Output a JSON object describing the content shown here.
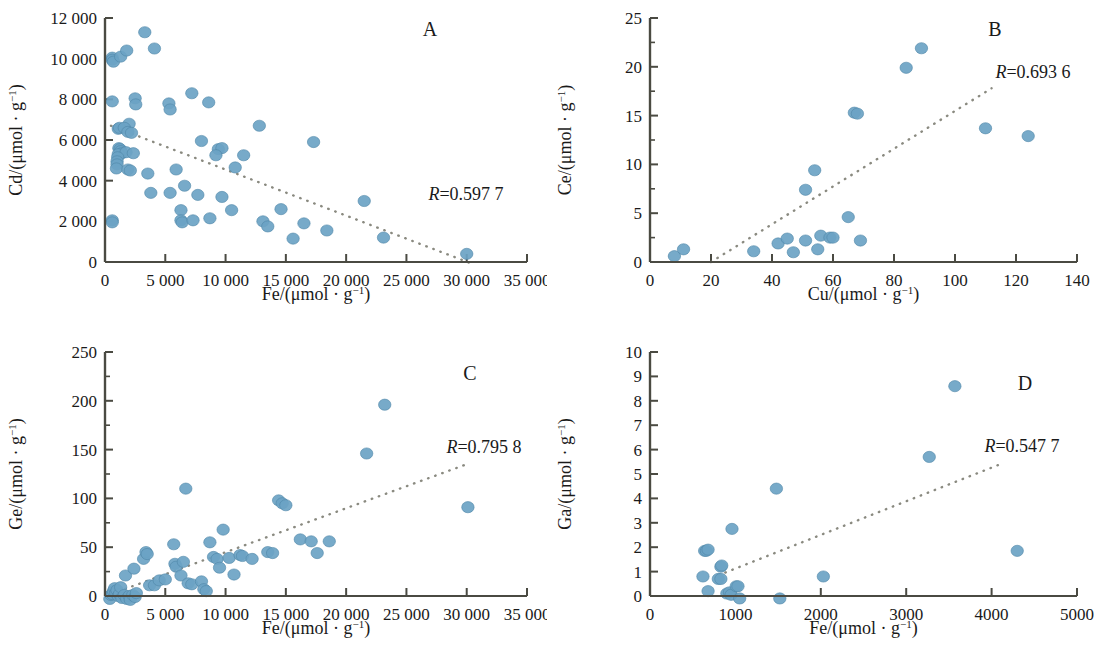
{
  "figure": {
    "background": "#ffffff",
    "point_color": "#6ba3c4",
    "point_stroke": "#4f87a8",
    "axis_color": "#4a4a42",
    "trend_color": "#8a8a80"
  },
  "panels": [
    {
      "id": "panel-a",
      "letter": "A",
      "r_prefix": "R",
      "r_equals": "=",
      "r_value": "0.597 7",
      "r_text": "R=0.597 7",
      "chart_data": {
        "type": "scatter",
        "title": "A",
        "xlabel": "Fe/(μmol · g⁻¹)",
        "ylabel": "Cd/(μmol · g⁻¹)",
        "xlim": [
          0,
          35000
        ],
        "ylim": [
          0,
          12000
        ],
        "xticks": [
          0,
          5000,
          10000,
          15000,
          20000,
          25000,
          30000,
          35000
        ],
        "xtick_labels": [
          "0",
          "5 000",
          "10 000",
          "15 000",
          "20 000",
          "25 000",
          "30 000",
          "35 000"
        ],
        "yticks": [
          0,
          2000,
          4000,
          6000,
          8000,
          10000,
          12000
        ],
        "ytick_labels": [
          "0",
          "2 000",
          "4 000",
          "6 000",
          "8 000",
          "10 000",
          "12 000"
        ],
        "grid": false,
        "legend": "none",
        "annotations": [
          {
            "text": "R=0.597 7",
            "x": 25500,
            "y": 3000
          }
        ],
        "trendline": {
          "x": [
            500,
            30500
          ],
          "y": [
            6700,
            -100
          ],
          "style": "dotted"
        },
        "points": [
          [
            600,
            10050
          ],
          [
            600,
            9950
          ],
          [
            700,
            9850
          ],
          [
            1300,
            10100
          ],
          [
            1800,
            10400
          ],
          [
            3300,
            11300
          ],
          [
            4100,
            10500
          ],
          [
            600,
            7900
          ],
          [
            2500,
            8050
          ],
          [
            2550,
            7750
          ],
          [
            5300,
            7800
          ],
          [
            5400,
            7500
          ],
          [
            7200,
            8300
          ],
          [
            8600,
            7850
          ],
          [
            2000,
            6800
          ],
          [
            1100,
            6550
          ],
          [
            1200,
            6600
          ],
          [
            1600,
            6600
          ],
          [
            1900,
            6400
          ],
          [
            2200,
            6350
          ],
          [
            12800,
            6700
          ],
          [
            17300,
            5900
          ],
          [
            8000,
            5950
          ],
          [
            9400,
            5550
          ],
          [
            9700,
            5600
          ],
          [
            9200,
            5250
          ],
          [
            11500,
            5250
          ],
          [
            1150,
            5600
          ],
          [
            1250,
            5550
          ],
          [
            1300,
            5450
          ],
          [
            1400,
            5350
          ],
          [
            1100,
            5300
          ],
          [
            1750,
            5400
          ],
          [
            2350,
            5350
          ],
          [
            1050,
            5150
          ],
          [
            1000,
            4950
          ],
          [
            1000,
            4800
          ],
          [
            950,
            4600
          ],
          [
            1900,
            4550
          ],
          [
            2100,
            4500
          ],
          [
            3550,
            4350
          ],
          [
            5900,
            4550
          ],
          [
            10800,
            4650
          ],
          [
            6600,
            3750
          ],
          [
            3800,
            3400
          ],
          [
            5400,
            3400
          ],
          [
            7700,
            3300
          ],
          [
            9700,
            3200
          ],
          [
            21500,
            3000
          ],
          [
            6300,
            2550
          ],
          [
            10500,
            2550
          ],
          [
            14600,
            2600
          ],
          [
            6300,
            2050
          ],
          [
            6400,
            1950
          ],
          [
            7300,
            2050
          ],
          [
            8700,
            2150
          ],
          [
            600,
            2050
          ],
          [
            600,
            1950
          ],
          [
            13100,
            2000
          ],
          [
            13500,
            1750
          ],
          [
            16500,
            1900
          ],
          [
            18400,
            1550
          ],
          [
            15600,
            1150
          ],
          [
            23100,
            1200
          ],
          [
            30000,
            400
          ]
        ]
      }
    },
    {
      "id": "panel-b",
      "letter": "B",
      "r_prefix": "R",
      "r_equals": "=",
      "r_value": "0.693 6",
      "r_text": "R=0.693 6",
      "chart_data": {
        "type": "scatter",
        "title": "B",
        "xlabel": "Cu/(μmol · g⁻¹)",
        "ylabel": "Ce/(μmol · g⁻¹)",
        "xlim": [
          0,
          140
        ],
        "ylim": [
          0,
          25
        ],
        "xticks": [
          0,
          20,
          40,
          60,
          80,
          100,
          120,
          140
        ],
        "xtick_labels": [
          "0",
          "20",
          "40",
          "60",
          "80",
          "100",
          "120",
          "140"
        ],
        "yticks": [
          0,
          5,
          10,
          15,
          20,
          25
        ],
        "ytick_labels": [
          "0",
          "5",
          "10",
          "15",
          "20",
          "25"
        ],
        "minor_yticks": [
          2.5,
          7.5,
          12.5,
          17.5,
          22.5
        ],
        "grid": false,
        "legend": "none",
        "annotations": [
          {
            "text": "R=0.693 6",
            "x": 122,
            "y": 20.5
          }
        ],
        "trendline": {
          "x": [
            20,
            112
          ],
          "y": [
            0,
            17.8
          ],
          "style": "dotted"
        },
        "points": [
          [
            8,
            0.6
          ],
          [
            11,
            1.3
          ],
          [
            34,
            1.1
          ],
          [
            42,
            1.9
          ],
          [
            45,
            2.4
          ],
          [
            47,
            1.0
          ],
          [
            51,
            2.2
          ],
          [
            51,
            7.4
          ],
          [
            54,
            9.4
          ],
          [
            55,
            1.3
          ],
          [
            56,
            2.7
          ],
          [
            59,
            2.5
          ],
          [
            60,
            2.5
          ],
          [
            65,
            4.6
          ],
          [
            67,
            15.3
          ],
          [
            68,
            15.2
          ],
          [
            69,
            2.2
          ],
          [
            84,
            19.9
          ],
          [
            89,
            21.9
          ],
          [
            110,
            13.7
          ],
          [
            124,
            12.9
          ]
        ]
      }
    },
    {
      "id": "panel-c",
      "letter": "C",
      "r_prefix": "R",
      "r_equals": "=",
      "r_value": "0.795 8",
      "r_text": "R=0.795 8",
      "chart_data": {
        "type": "scatter",
        "title": "C",
        "xlabel": "Fe/(μmol · g⁻¹)",
        "ylabel": "Ge/(μmol · g⁻¹)",
        "xlim": [
          0,
          35000
        ],
        "ylim": [
          0,
          250
        ],
        "xticks": [
          0,
          5000,
          10000,
          15000,
          20000,
          25000,
          30000,
          35000
        ],
        "xtick_labels": [
          "0",
          "5 000",
          "10 000",
          "15 000",
          "20 000",
          "25 000",
          "30 000",
          "35 000"
        ],
        "yticks": [
          0,
          50,
          100,
          150,
          200,
          250
        ],
        "ytick_labels": [
          "0",
          "50",
          "100",
          "150",
          "200",
          "250"
        ],
        "minor_yticks": [
          25,
          75,
          125,
          175,
          225
        ],
        "grid": false,
        "legend": "none",
        "annotations": [
          {
            "text": "R=0.795 8",
            "x": 26500,
            "y": 150
          }
        ],
        "trendline": {
          "x": [
            500,
            30000
          ],
          "y": [
            2,
            135
          ],
          "style": "dotted"
        },
        "points": [
          [
            400,
            -3
          ],
          [
            500,
            1
          ],
          [
            600,
            2
          ],
          [
            700,
            5
          ],
          [
            800,
            8
          ],
          [
            900,
            3
          ],
          [
            1000,
            6
          ],
          [
            1100,
            0
          ],
          [
            1200,
            2
          ],
          [
            1300,
            9
          ],
          [
            1400,
            -2
          ],
          [
            1600,
            1
          ],
          [
            1800,
            -3
          ],
          [
            2000,
            0
          ],
          [
            2100,
            -4
          ],
          [
            2300,
            1
          ],
          [
            2500,
            -1
          ],
          [
            2600,
            3
          ],
          [
            1700,
            21
          ],
          [
            2400,
            28
          ],
          [
            3200,
            38
          ],
          [
            3400,
            45
          ],
          [
            3500,
            43
          ],
          [
            3700,
            11
          ],
          [
            4100,
            11
          ],
          [
            4500,
            16
          ],
          [
            5000,
            17
          ],
          [
            5700,
            53
          ],
          [
            5800,
            33
          ],
          [
            5900,
            30
          ],
          [
            6300,
            21
          ],
          [
            6500,
            35
          ],
          [
            6700,
            110
          ],
          [
            6900,
            13
          ],
          [
            7200,
            12
          ],
          [
            8000,
            15
          ],
          [
            8200,
            7
          ],
          [
            8400,
            5
          ],
          [
            8700,
            55
          ],
          [
            9000,
            40
          ],
          [
            9300,
            38
          ],
          [
            9500,
            29
          ],
          [
            9800,
            68
          ],
          [
            10300,
            39
          ],
          [
            10700,
            22
          ],
          [
            11200,
            42
          ],
          [
            11400,
            41
          ],
          [
            12200,
            38
          ],
          [
            13500,
            45
          ],
          [
            13900,
            44
          ],
          [
            14400,
            98
          ],
          [
            14700,
            95
          ],
          [
            15000,
            93
          ],
          [
            16200,
            58
          ],
          [
            17100,
            56
          ],
          [
            17600,
            44
          ],
          [
            18600,
            56
          ],
          [
            21700,
            146
          ],
          [
            23200,
            196
          ],
          [
            30100,
            91
          ]
        ]
      }
    },
    {
      "id": "panel-d",
      "letter": "D",
      "r_prefix": "R",
      "r_equals": "=",
      "r_value": "0.547 7",
      "r_text": "R=0.547 7",
      "chart_data": {
        "type": "scatter",
        "title": "D",
        "xlabel": "Fe/(μmol · g⁻¹)",
        "ylabel": "Ga/(μmol · g⁻¹)",
        "xlim": [
          0,
          5000
        ],
        "ylim": [
          0,
          10
        ],
        "xticks": [
          0,
          1000,
          2000,
          3000,
          4000,
          5000
        ],
        "xtick_labels": [
          "0",
          "1000",
          "2000",
          "3000",
          "4000",
          "5000"
        ],
        "yticks": [
          0,
          1,
          2,
          3,
          4,
          5,
          6,
          7,
          8,
          9,
          10
        ],
        "ytick_labels": [
          "0",
          "1",
          "2",
          "3",
          "4",
          "5",
          "6",
          "7",
          "8",
          "9",
          "10"
        ],
        "grid": false,
        "legend": "none",
        "annotations": [
          {
            "text": "R=0.547 7",
            "x": 4250,
            "y": 6.0
          }
        ],
        "trendline": {
          "x": [
            800,
            4100
          ],
          "y": [
            0.85,
            5.4
          ],
          "style": "dotted"
        },
        "points": [
          [
            620,
            0.8
          ],
          [
            640,
            1.85
          ],
          [
            660,
            1.85
          ],
          [
            680,
            1.9
          ],
          [
            680,
            0.2
          ],
          [
            830,
            1.2
          ],
          [
            840,
            1.25
          ],
          [
            800,
            0.7
          ],
          [
            830,
            0.7
          ],
          [
            900,
            0.1
          ],
          [
            930,
            0.15
          ],
          [
            950,
            0.05
          ],
          [
            960,
            2.75
          ],
          [
            1010,
            0.4
          ],
          [
            1030,
            0.4
          ],
          [
            1050,
            -0.1
          ],
          [
            1480,
            4.4
          ],
          [
            1520,
            -0.1
          ],
          [
            2030,
            0.8
          ],
          [
            3270,
            5.7
          ],
          [
            3570,
            8.6
          ],
          [
            4300,
            1.85
          ]
        ]
      }
    }
  ]
}
